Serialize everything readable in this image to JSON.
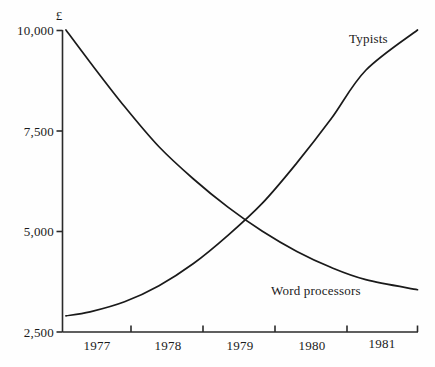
{
  "chart_data": {
    "type": "line",
    "title": "",
    "subtitle": "",
    "xlabel": "",
    "ylabel": "£",
    "ylabel_full": "£",
    "xlim": [
      1976.6,
      1981.75
    ],
    "ylim": [
      2500,
      10000
    ],
    "grid": false,
    "legend_position": "inline-annotations",
    "y_ticks": [
      2500,
      5000,
      7500,
      10000
    ],
    "y_tick_labels": [
      "2,500",
      "5,000",
      "7,500",
      "10,000"
    ],
    "x_ticks": [
      1977.5,
      1978.5,
      1979.5,
      1980.5,
      1981.75
    ],
    "x_tick_labels": [
      "1977",
      "1978",
      "1979",
      "1980",
      "1981"
    ],
    "x_categories": [
      "1977",
      "1978",
      "1979",
      "1980",
      "1981"
    ],
    "crossing_point": {
      "x": 1979.4,
      "y": 5600
    },
    "series": [
      {
        "name": "Typists",
        "label": "Typists",
        "color": "#1a1a1a",
        "x": [
          1976.65,
          1977.0,
          1977.5,
          1978.0,
          1978.5,
          1979.0,
          1979.5,
          1980.0,
          1980.5,
          1981.0,
          1981.75
        ],
        "values": [
          2900,
          3000,
          3250,
          3650,
          4200,
          4900,
          5700,
          6700,
          7800,
          9000,
          10000
        ]
      },
      {
        "name": "Word processors",
        "label": "Word processors",
        "color": "#1a1a1a",
        "x": [
          1976.65,
          1977.0,
          1977.5,
          1978.0,
          1978.5,
          1979.0,
          1979.5,
          1980.0,
          1980.5,
          1981.0,
          1981.75
        ],
        "values": [
          10000,
          9200,
          8100,
          7100,
          6300,
          5600,
          5000,
          4500,
          4100,
          3800,
          3550
        ]
      }
    ],
    "annotations": [
      {
        "text": "Typists",
        "x": 1980.35,
        "y": 9500
      },
      {
        "text": "Word processors",
        "x": 1979.55,
        "y": 3600
      }
    ]
  },
  "figure": {
    "axis_color": "#2a2a2a",
    "background": "#fefefe",
    "currency": "£"
  }
}
